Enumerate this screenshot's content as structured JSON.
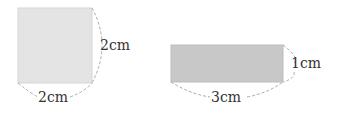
{
  "shapes": [
    {
      "name": "square",
      "width_label": "2cm",
      "height_label": "2cm",
      "fill": "#e4e4e4"
    },
    {
      "name": "rectangle",
      "width_label": "3cm",
      "height_label": "1cm",
      "fill": "#c8c8c8"
    }
  ],
  "colors": {
    "dashed": "#aaaaaa",
    "text": "#333333"
  }
}
